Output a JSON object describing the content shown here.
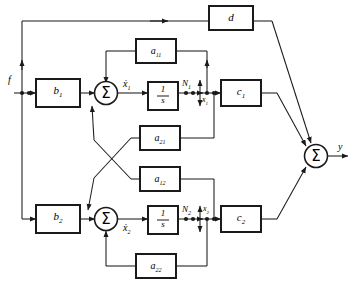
{
  "diagram": {
    "stroke_color": "#1a1a1a",
    "block_fill": "#ffffff",
    "background": "#ffffff",
    "blocks": [
      {
        "id": "b1",
        "label": "b",
        "sub": "1",
        "x": 36,
        "y": 79,
        "w": 44,
        "h": 28
      },
      {
        "id": "b2",
        "label": "b",
        "sub": "2",
        "x": 36,
        "y": 205,
        "w": 44,
        "h": 28
      },
      {
        "id": "a11",
        "label": "a",
        "sub": "11",
        "x": 136,
        "y": 39,
        "w": 40,
        "h": 24
      },
      {
        "id": "a21",
        "label": "a",
        "sub": "21",
        "x": 140,
        "y": 126,
        "w": 40,
        "h": 24
      },
      {
        "id": "a12",
        "label": "a",
        "sub": "12",
        "x": 140,
        "y": 167,
        "w": 40,
        "h": 24
      },
      {
        "id": "a22",
        "label": "a",
        "sub": "22",
        "x": 136,
        "y": 254,
        "w": 40,
        "h": 24
      },
      {
        "id": "int1",
        "label": "1/s",
        "sub": "",
        "x": 148,
        "y": 82,
        "w": 30,
        "h": 28
      },
      {
        "id": "int2",
        "label": "1/s",
        "sub": "",
        "x": 148,
        "y": 206,
        "w": 30,
        "h": 28
      },
      {
        "id": "c1",
        "label": "c",
        "sub": "1",
        "x": 221,
        "y": 80,
        "w": 40,
        "h": 26
      },
      {
        "id": "c2",
        "label": "c",
        "sub": "2",
        "x": 221,
        "y": 206,
        "w": 40,
        "h": 26
      },
      {
        "id": "d",
        "label": "d",
        "sub": "",
        "x": 209,
        "y": 6,
        "w": 44,
        "h": 24
      }
    ],
    "summers": [
      {
        "id": "sum1",
        "glyph": "Σ",
        "cx": 106,
        "cy": 94
      },
      {
        "id": "sum2",
        "glyph": "Σ",
        "cx": 106,
        "cy": 220
      },
      {
        "id": "sumy",
        "glyph": "Σ",
        "cx": 316,
        "cy": 156
      }
    ],
    "signals": [
      {
        "id": "input-f",
        "label": "f",
        "sub": "",
        "x": 8,
        "y": 76
      },
      {
        "id": "xdot1",
        "label": "ẋ",
        "sub": "1",
        "x": 126,
        "y": 80
      },
      {
        "id": "xdot2",
        "label": "ẋ",
        "sub": "2",
        "x": 126,
        "y": 226
      },
      {
        "id": "node-N1",
        "label": "N",
        "sub": "1",
        "x": 184,
        "y": 80
      },
      {
        "id": "node-N2",
        "label": "N",
        "sub": "2",
        "x": 184,
        "y": 206
      },
      {
        "id": "state-x1",
        "label": "x",
        "sub": "1",
        "x": 201,
        "y": 96
      },
      {
        "id": "state-x2",
        "label": "x",
        "sub": "2",
        "x": 202,
        "y": 206
      },
      {
        "id": "output-y",
        "label": "y",
        "sub": "",
        "x": 340,
        "y": 142
      }
    ],
    "junction_dots": [
      {
        "id": "dot-f-split",
        "cx": 22,
        "cy": 93
      },
      {
        "id": "dot-f-in",
        "cx": 28,
        "cy": 93
      },
      {
        "id": "dot-n1-a",
        "cx": 185,
        "cy": 93
      },
      {
        "id": "dot-n1-b",
        "cx": 192,
        "cy": 93
      },
      {
        "id": "dot-n1-c",
        "cx": 200,
        "cy": 93
      },
      {
        "id": "dot-n2-a",
        "cx": 185,
        "cy": 219
      },
      {
        "id": "dot-n2-b",
        "cx": 192,
        "cy": 219
      },
      {
        "id": "dot-n2-c",
        "cx": 200,
        "cy": 219
      }
    ]
  }
}
